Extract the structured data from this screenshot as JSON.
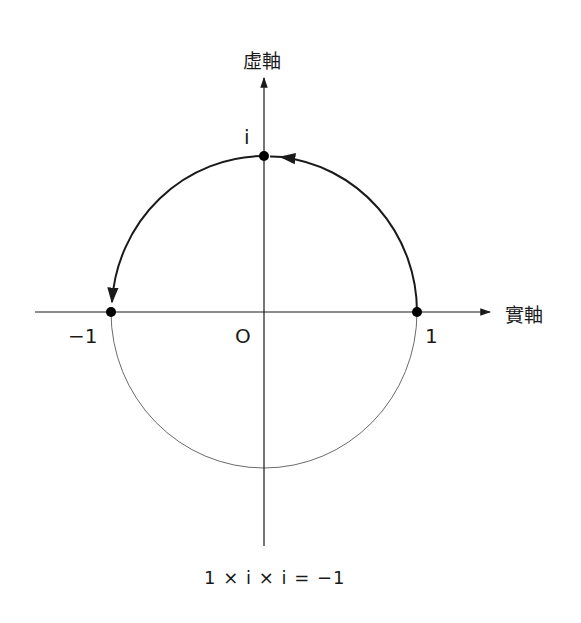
{
  "diagram": {
    "axes": {
      "imaginary_label": "虛軸",
      "real_label": "實軸"
    },
    "points": {
      "i_label": "i",
      "minus_one_label": "−1",
      "origin_label": "O",
      "one_label": "1"
    },
    "formula": "1 × i × i = −1",
    "colors": {
      "line": "#1a1a1a",
      "thin_circle": "#6b6b6b",
      "background": "#ffffff"
    }
  }
}
